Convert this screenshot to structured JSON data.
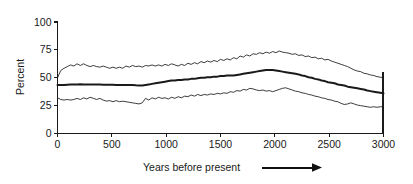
{
  "figure": {
    "background_color": "#ffffff",
    "ink_color": "#1a1a1a"
  },
  "chart_data": {
    "type": "line",
    "title": "",
    "subtitle": "",
    "xlabel": "Years before present",
    "ylabel": "Percent",
    "xlim": [
      0,
      3000
    ],
    "ylim": [
      0,
      100
    ],
    "xticks": [
      0,
      500,
      1000,
      1500,
      2000,
      2500,
      3000
    ],
    "xtick_labels": [
      "0",
      "500",
      "1000",
      "1500",
      "2000",
      "2500",
      "3000"
    ],
    "yticks": [
      0,
      25,
      50,
      75,
      100
    ],
    "ytick_labels": [
      "0",
      "25",
      "50",
      "75",
      "100"
    ],
    "grid": false,
    "legend": null,
    "legend_position": "none",
    "annotations": [
      {
        "name": "direction-arrow",
        "text": "",
        "description": "rightward arrow following the x-axis title",
        "direction": "right"
      }
    ],
    "x": [
      0,
      30,
      60,
      90,
      120,
      150,
      180,
      210,
      240,
      270,
      300,
      330,
      360,
      390,
      420,
      450,
      480,
      510,
      540,
      570,
      600,
      630,
      660,
      690,
      720,
      750,
      780,
      810,
      840,
      870,
      900,
      930,
      960,
      990,
      1020,
      1050,
      1080,
      1110,
      1140,
      1170,
      1200,
      1230,
      1260,
      1290,
      1320,
      1350,
      1380,
      1410,
      1440,
      1470,
      1500,
      1530,
      1560,
      1590,
      1620,
      1650,
      1680,
      1710,
      1740,
      1770,
      1800,
      1830,
      1860,
      1890,
      1920,
      1950,
      1980,
      2010,
      2040,
      2070,
      2100,
      2130,
      2160,
      2190,
      2220,
      2250,
      2280,
      2310,
      2340,
      2370,
      2400,
      2430,
      2460,
      2490,
      2520,
      2550,
      2580,
      2610,
      2640,
      2670,
      2700,
      2730,
      2760,
      2790,
      2820,
      2850,
      2880,
      2910,
      2940,
      2970,
      3000
    ],
    "series": [
      {
        "name": "upper-bound",
        "style": "thin",
        "values": [
          50.0,
          56.5,
          58.5,
          60.0,
          61.5,
          60.5,
          62.5,
          61.0,
          62.5,
          61.0,
          60.0,
          61.0,
          60.0,
          59.5,
          60.5,
          59.5,
          58.5,
          59.5,
          58.5,
          59.5,
          58.5,
          60.5,
          59.5,
          61.0,
          60.0,
          60.5,
          59.5,
          61.0,
          60.5,
          61.5,
          60.5,
          61.5,
          60.5,
          62.0,
          61.0,
          62.5,
          61.5,
          60.5,
          62.0,
          61.0,
          63.0,
          62.0,
          63.5,
          62.5,
          64.5,
          63.5,
          65.0,
          64.0,
          65.5,
          64.5,
          66.5,
          65.5,
          67.0,
          66.0,
          68.0,
          67.0,
          69.5,
          68.5,
          70.5,
          69.5,
          71.5,
          71.0,
          72.5,
          71.5,
          73.0,
          72.0,
          73.5,
          72.5,
          74.0,
          73.0,
          72.5,
          72.0,
          71.0,
          71.5,
          70.0,
          70.5,
          69.0,
          69.5,
          68.0,
          68.5,
          67.0,
          67.5,
          66.0,
          66.5,
          65.0,
          64.0,
          63.0,
          62.0,
          61.0,
          60.0,
          58.5,
          57.0,
          56.0,
          55.5,
          54.0,
          53.5,
          52.5,
          52.0,
          51.0,
          50.5,
          50.0
        ]
      },
      {
        "name": "mean",
        "style": "thick",
        "values": [
          43.5,
          43.5,
          43.5,
          43.8,
          44.0,
          44.0,
          44.0,
          44.2,
          44.0,
          44.0,
          44.0,
          44.0,
          44.0,
          44.0,
          43.8,
          43.8,
          43.8,
          43.8,
          43.5,
          43.5,
          43.5,
          43.5,
          43.5,
          43.5,
          43.2,
          43.0,
          43.0,
          43.5,
          44.0,
          44.5,
          45.0,
          45.5,
          46.0,
          46.5,
          47.0,
          47.5,
          47.5,
          48.0,
          48.0,
          48.5,
          48.5,
          49.0,
          49.0,
          49.5,
          50.0,
          50.0,
          50.5,
          50.5,
          51.0,
          51.0,
          51.5,
          51.5,
          52.0,
          52.0,
          52.0,
          52.5,
          53.0,
          53.5,
          54.0,
          54.5,
          55.0,
          55.5,
          56.0,
          56.5,
          57.0,
          57.0,
          57.0,
          56.5,
          56.0,
          55.5,
          55.0,
          54.5,
          54.0,
          53.5,
          53.0,
          52.0,
          51.5,
          50.5,
          50.0,
          49.0,
          48.5,
          47.5,
          47.0,
          46.0,
          45.5,
          45.0,
          44.0,
          43.5,
          43.0,
          42.0,
          41.5,
          41.0,
          40.5,
          40.0,
          39.5,
          38.5,
          38.0,
          37.5,
          37.0,
          36.5,
          36.0
        ]
      },
      {
        "name": "lower-bound",
        "style": "thin",
        "values": [
          32.0,
          30.5,
          30.0,
          30.5,
          30.0,
          30.5,
          31.5,
          30.5,
          32.0,
          31.0,
          32.5,
          31.5,
          30.5,
          31.5,
          30.0,
          29.0,
          29.5,
          28.5,
          29.5,
          28.5,
          29.0,
          28.5,
          28.0,
          27.5,
          27.0,
          26.5,
          27.5,
          31.5,
          30.0,
          32.0,
          31.0,
          32.5,
          31.5,
          32.0,
          31.0,
          32.5,
          31.5,
          33.0,
          32.0,
          33.5,
          33.0,
          34.5,
          33.5,
          35.0,
          34.0,
          35.0,
          34.5,
          35.5,
          35.0,
          36.0,
          35.5,
          36.5,
          36.0,
          37.5,
          37.0,
          38.5,
          38.0,
          39.5,
          39.0,
          40.5,
          40.0,
          39.0,
          38.5,
          39.0,
          38.0,
          38.5,
          37.5,
          38.5,
          39.5,
          40.5,
          41.0,
          40.0,
          39.0,
          38.0,
          37.5,
          36.5,
          36.0,
          35.0,
          34.5,
          33.5,
          33.0,
          32.0,
          31.5,
          30.5,
          30.0,
          29.0,
          28.5,
          27.0,
          26.0,
          26.5,
          27.5,
          26.5,
          25.5,
          25.0,
          24.5,
          24.0,
          23.5,
          24.0,
          23.5,
          24.0,
          24.0
        ]
      }
    ]
  }
}
